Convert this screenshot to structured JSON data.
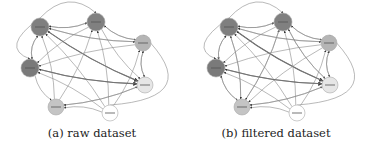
{
  "figure": {
    "panels": [
      {
        "id": "a",
        "caption": "(a) raw dataset",
        "nodes": [
          {
            "id": "n1",
            "x": 40,
            "y": 27,
            "r": 9,
            "fill": "#7f7f7f"
          },
          {
            "id": "n2",
            "x": 96,
            "y": 22,
            "r": 9,
            "fill": "#808080"
          },
          {
            "id": "n3",
            "x": 143,
            "y": 43,
            "r": 8,
            "fill": "#b5b5b5"
          },
          {
            "id": "n4",
            "x": 30,
            "y": 68,
            "r": 9,
            "fill": "#7a7a7a"
          },
          {
            "id": "n5",
            "x": 145,
            "y": 85,
            "r": 8,
            "fill": "#e6e6e6"
          },
          {
            "id": "n6",
            "x": 56,
            "y": 107,
            "r": 8,
            "fill": "#c4c4c4"
          },
          {
            "id": "n7",
            "x": 110,
            "y": 113,
            "r": 8,
            "fill": "#ffffff"
          }
        ],
        "edges": [
          [
            "n1",
            "n2",
            1
          ],
          [
            "n2",
            "n1",
            1
          ],
          [
            "n1",
            "n3",
            1
          ],
          [
            "n3",
            "n1",
            1
          ],
          [
            "n1",
            "n4",
            1
          ],
          [
            "n4",
            "n1",
            1
          ],
          [
            "n1",
            "n5",
            2
          ],
          [
            "n5",
            "n1",
            1
          ],
          [
            "n6",
            "n1",
            1
          ],
          [
            "n7",
            "n1",
            1
          ],
          [
            "n2",
            "n3",
            1
          ],
          [
            "n3",
            "n2",
            1
          ],
          [
            "n2",
            "n4",
            1
          ],
          [
            "n2",
            "n5",
            1
          ],
          [
            "n6",
            "n2",
            1
          ],
          [
            "n7",
            "n2",
            1
          ],
          [
            "n3",
            "n4",
            1
          ],
          [
            "n3",
            "n5",
            1
          ],
          [
            "n5",
            "n3",
            1
          ],
          [
            "n7",
            "n3",
            1
          ],
          [
            "n4",
            "n5",
            2
          ],
          [
            "n5",
            "n4",
            1
          ],
          [
            "n4",
            "n6",
            1
          ],
          [
            "n7",
            "n4",
            1
          ],
          [
            "n6",
            "n5",
            1
          ],
          [
            "n5",
            "n6",
            1
          ],
          [
            "n7",
            "n6",
            1
          ]
        ],
        "curves": [
          {
            "from": "n1",
            "to": "n2",
            "dx": 0,
            "dy": -18
          },
          {
            "from": "n1",
            "to": "n4",
            "dx": -18,
            "dy": 0
          },
          {
            "from": "n7",
            "to": "n3",
            "dx": 40,
            "dy": 10
          }
        ]
      },
      {
        "id": "b",
        "caption": "(b) filtered dataset",
        "nodes": [
          {
            "id": "n1",
            "x": 45,
            "y": 27,
            "r": 9,
            "fill": "#7f7f7f"
          },
          {
            "id": "n2",
            "x": 99,
            "y": 22,
            "r": 9,
            "fill": "#808080"
          },
          {
            "id": "n3",
            "x": 145,
            "y": 43,
            "r": 8,
            "fill": "#b5b5b5"
          },
          {
            "id": "n4",
            "x": 32,
            "y": 68,
            "r": 9,
            "fill": "#7a7a7a"
          },
          {
            "id": "n5",
            "x": 146,
            "y": 85,
            "r": 8,
            "fill": "#e6e6e6"
          },
          {
            "id": "n6",
            "x": 58,
            "y": 107,
            "r": 8,
            "fill": "#c4c4c4"
          },
          {
            "id": "n7",
            "x": 113,
            "y": 113,
            "r": 8,
            "fill": "#ffffff"
          }
        ],
        "edges": [
          [
            "n1",
            "n2",
            1
          ],
          [
            "n2",
            "n1",
            1
          ],
          [
            "n1",
            "n3",
            1
          ],
          [
            "n3",
            "n1",
            1
          ],
          [
            "n1",
            "n4",
            1
          ],
          [
            "n4",
            "n1",
            1
          ],
          [
            "n1",
            "n5",
            2
          ],
          [
            "n5",
            "n1",
            1
          ],
          [
            "n6",
            "n1",
            1
          ],
          [
            "n1",
            "n6",
            1
          ],
          [
            "n7",
            "n1",
            1
          ],
          [
            "n2",
            "n3",
            1
          ],
          [
            "n3",
            "n2",
            1
          ],
          [
            "n2",
            "n4",
            1
          ],
          [
            "n2",
            "n5",
            1
          ],
          [
            "n6",
            "n2",
            1
          ],
          [
            "n2",
            "n6",
            1
          ],
          [
            "n7",
            "n2",
            1
          ],
          [
            "n3",
            "n4",
            1
          ],
          [
            "n3",
            "n5",
            1
          ],
          [
            "n5",
            "n3",
            1
          ],
          [
            "n7",
            "n3",
            1
          ],
          [
            "n3",
            "n6",
            1
          ],
          [
            "n4",
            "n5",
            2
          ],
          [
            "n5",
            "n4",
            1
          ],
          [
            "n4",
            "n6",
            1
          ],
          [
            "n6",
            "n4",
            1
          ],
          [
            "n7",
            "n4",
            1
          ],
          [
            "n6",
            "n5",
            1
          ],
          [
            "n5",
            "n6",
            1
          ],
          [
            "n7",
            "n6",
            1
          ],
          [
            "n5",
            "n2",
            1
          ]
        ],
        "curves": [
          {
            "from": "n1",
            "to": "n2",
            "dx": 0,
            "dy": -18
          },
          {
            "from": "n1",
            "to": "n4",
            "dx": -18,
            "dy": 0
          },
          {
            "from": "n7",
            "to": "n3",
            "dx": 40,
            "dy": 10
          }
        ]
      }
    ],
    "colors": {
      "edge": "#8a8a8a",
      "edge_strong": "#555555",
      "node_stroke": "#aaaaaa",
      "arrow": "#333333"
    }
  }
}
